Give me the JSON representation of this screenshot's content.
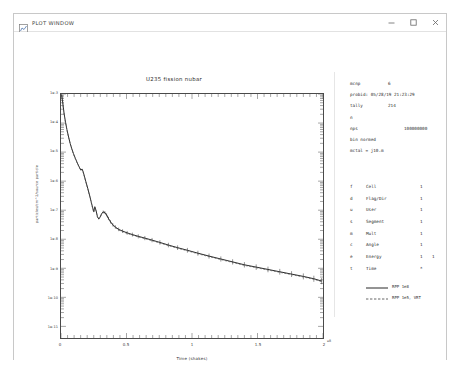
{
  "window": {
    "title": "PLOT WINDOW",
    "icon": "plot-window-icon",
    "controls": {
      "minimize": "minimize-icon",
      "maximize": "maximize-icon",
      "close": "close-icon"
    }
  },
  "chart_data": {
    "type": "line",
    "title": "U235 fission nubar",
    "xlabel": "Time (shakes)",
    "ylabel": "particles/cm^2/source particle",
    "x_exponent": "e8",
    "xlim": [
      0,
      2
    ],
    "ylim_decades": [
      "1e-3",
      "1e-11"
    ],
    "xticks": [
      "0",
      "0.5",
      "1",
      "1.5",
      "2"
    ],
    "xtick_values": [
      0,
      0.5,
      1,
      1.5,
      2
    ],
    "yticks": [
      "1e-3",
      "1e-4",
      "1e-5",
      "1e-6",
      "1e-7",
      "1e-8",
      "1e-9",
      "1e-10",
      "1e-11"
    ],
    "ytick_values": [
      -3,
      -4,
      -5,
      -6,
      -7,
      -8,
      -9,
      -10,
      -11
    ],
    "grid": false,
    "legend_position": "right",
    "series": [
      {
        "name": "RPP 1e8",
        "style": "solid",
        "color": "#111111",
        "x": [
          0.005,
          0.01,
          0.016,
          0.022,
          0.028,
          0.035,
          0.045,
          0.058,
          0.07,
          0.082,
          0.095,
          0.11,
          0.125,
          0.14,
          0.152,
          0.16,
          0.168,
          0.178,
          0.19,
          0.205,
          0.22,
          0.232,
          0.242,
          0.25,
          0.258,
          0.268,
          0.278,
          0.288,
          0.298,
          0.31,
          0.322,
          0.335,
          0.348,
          0.362,
          0.378,
          0.395,
          0.415,
          0.44,
          0.47,
          0.505,
          0.545,
          0.59,
          0.64,
          0.695,
          0.755,
          0.82,
          0.89,
          0.965,
          1.045,
          1.13,
          1.22,
          1.31,
          1.4,
          1.49,
          1.58,
          1.67,
          1.76,
          1.85,
          1.93,
          1.99
        ],
        "y": [
          -3.02,
          -3.18,
          -3.4,
          -3.62,
          -3.8,
          -3.98,
          -4.22,
          -4.48,
          -4.7,
          -4.88,
          -5.05,
          -5.22,
          -5.38,
          -5.52,
          -5.62,
          -5.58,
          -5.66,
          -5.82,
          -6.02,
          -6.26,
          -6.52,
          -6.74,
          -6.92,
          -7.05,
          -6.88,
          -7.02,
          -7.22,
          -7.3,
          -7.24,
          -7.12,
          -7.06,
          -7.08,
          -7.16,
          -7.28,
          -7.4,
          -7.5,
          -7.58,
          -7.66,
          -7.72,
          -7.78,
          -7.84,
          -7.9,
          -7.96,
          -8.03,
          -8.11,
          -8.2,
          -8.29,
          -8.38,
          -8.48,
          -8.58,
          -8.68,
          -8.78,
          -8.88,
          -8.96,
          -9.04,
          -9.12,
          -9.2,
          -9.28,
          -9.36,
          -9.44
        ]
      },
      {
        "name": "RPP 1e5, VRT",
        "style": "dashed",
        "color": "#555555",
        "x": [
          0.005,
          0.01,
          0.016,
          0.022,
          0.028,
          0.035,
          0.045,
          0.058,
          0.07,
          0.082,
          0.095,
          0.11,
          0.125,
          0.14,
          0.152,
          0.16,
          0.168,
          0.178,
          0.19,
          0.205,
          0.22,
          0.232,
          0.242,
          0.25,
          0.258,
          0.268,
          0.278,
          0.288,
          0.298,
          0.31,
          0.322,
          0.335,
          0.348,
          0.362,
          0.378,
          0.395,
          0.415,
          0.44,
          0.47,
          0.505,
          0.545,
          0.59,
          0.64,
          0.695,
          0.755,
          0.82,
          0.89,
          0.965,
          1.045,
          1.13,
          1.22,
          1.31,
          1.4,
          1.49,
          1.58,
          1.67,
          1.76,
          1.85,
          1.93,
          1.99
        ],
        "y": [
          -3.04,
          -3.2,
          -3.42,
          -3.63,
          -3.82,
          -4.0,
          -4.24,
          -4.5,
          -4.71,
          -4.9,
          -5.07,
          -5.24,
          -5.39,
          -5.54,
          -5.64,
          -5.6,
          -5.68,
          -5.84,
          -6.04,
          -6.28,
          -6.54,
          -6.76,
          -6.94,
          -7.08,
          -6.9,
          -7.04,
          -7.24,
          -7.32,
          -7.26,
          -7.14,
          -7.08,
          -7.1,
          -7.18,
          -7.3,
          -7.42,
          -7.52,
          -7.6,
          -7.68,
          -7.74,
          -7.8,
          -7.86,
          -7.92,
          -7.98,
          -8.05,
          -8.13,
          -8.22,
          -8.31,
          -8.4,
          -8.5,
          -8.6,
          -8.7,
          -8.8,
          -8.9,
          -8.98,
          -9.06,
          -9.14,
          -9.22,
          -9.3,
          -9.38,
          -9.46
        ]
      }
    ]
  },
  "info": {
    "rows": [
      {
        "key": "mcnp",
        "value": "6",
        "layout": "key-value"
      },
      {
        "key": "probid:",
        "value": "05/28/19 21:23:29",
        "layout": "inline"
      },
      {
        "key": "tally",
        "value": "214",
        "layout": "key-value"
      },
      {
        "key": "n",
        "value": "",
        "layout": "key-only"
      },
      {
        "key": "nps",
        "value": "100000000",
        "layout": "key-value-wide"
      },
      {
        "key": "bin normed",
        "value": "",
        "layout": "free"
      },
      {
        "key": "mctal = j10.m",
        "value": "",
        "layout": "free"
      }
    ]
  },
  "bin_table": {
    "rows": [
      {
        "letter": "f",
        "name": "Cell",
        "c1": "1",
        "c2": ""
      },
      {
        "letter": "d",
        "name": "Flag/Dir",
        "c1": "1",
        "c2": ""
      },
      {
        "letter": "u",
        "name": "User",
        "c1": "1",
        "c2": ""
      },
      {
        "letter": "s",
        "name": "Segment",
        "c1": "1",
        "c2": ""
      },
      {
        "letter": "m",
        "name": "Mult",
        "c1": "1",
        "c2": ""
      },
      {
        "letter": "c",
        "name": "Angle",
        "c1": "1",
        "c2": ""
      },
      {
        "letter": "e",
        "name": "Energy",
        "c1": "1",
        "c2": "1"
      },
      {
        "letter": "t",
        "name": "Time",
        "c1": "*",
        "c2": ""
      }
    ]
  },
  "legend": {
    "items": [
      {
        "label": "RPP 1e8",
        "style": "solid",
        "color": "#111111"
      },
      {
        "label": "RPP 1e5, VRT",
        "style": "dashed",
        "color": "#555555"
      }
    ]
  }
}
